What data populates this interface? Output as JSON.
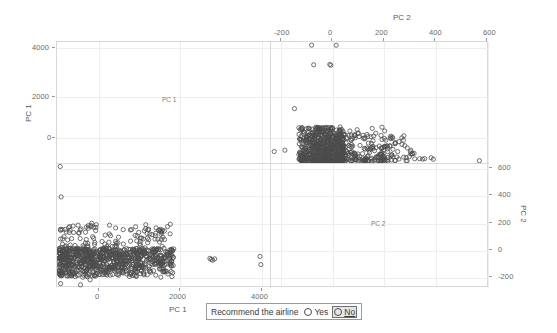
{
  "chart_data": {
    "type": "scatter",
    "title": "",
    "layout": "scatterplot-matrix",
    "variables": [
      "PC 1",
      "PC 2"
    ],
    "grid": true,
    "legend": {
      "position": "bottom",
      "title": "Recommend the airline",
      "entries": [
        {
          "label": "Yes",
          "marker": "open-circle",
          "color": "#4c4c4c",
          "selected": false
        },
        {
          "label": "No",
          "marker": "open-circle",
          "color": "#4c4c4c",
          "selected": true
        }
      ]
    },
    "panels": [
      {
        "id": "top-left",
        "row": 0,
        "col": 0,
        "diagonal": true,
        "cell_label": "PC 1",
        "x_variable": "PC 1",
        "y_variable": "PC 1",
        "n_points": 0
      },
      {
        "id": "top-right",
        "row": 0,
        "col": 1,
        "diagonal": false,
        "x_variable": "PC 2",
        "y_variable": "PC 1",
        "xlim": [
          -320,
          700
        ],
        "ylim": [
          -900,
          4400
        ],
        "n_points": 980
      },
      {
        "id": "bottom-left",
        "row": 1,
        "col": 0,
        "diagonal": false,
        "x_variable": "PC 1",
        "y_variable": "PC 2",
        "xlim": [
          -850,
          4500
        ],
        "ylim": [
          -280,
          700
        ],
        "n_points": 980
      },
      {
        "id": "bottom-right",
        "row": 1,
        "col": 1,
        "diagonal": true,
        "cell_label": "PC 2",
        "x_variable": "PC 2",
        "y_variable": "PC 2",
        "n_points": 0
      }
    ],
    "axes": {
      "left": {
        "title": "PC 1",
        "variable": "PC 1",
        "ticks": [
          4000,
          2000,
          0
        ],
        "tick_labels": [
          "4000",
          "2000",
          "0"
        ],
        "range": [
          -900,
          4400
        ]
      },
      "top": {
        "title": "PC 2",
        "variable": "PC 2",
        "ticks": [
          -200,
          0,
          200,
          400,
          600
        ],
        "tick_labels": [
          "-200",
          "0",
          "200",
          "400",
          "600"
        ],
        "range": [
          -320,
          700
        ]
      },
      "right": {
        "title": "PC 2",
        "variable": "PC 2",
        "ticks": [
          600,
          400,
          200,
          0,
          -200
        ],
        "tick_labels": [
          "600",
          "400",
          "200",
          "0",
          "-200"
        ],
        "range": [
          -280,
          700
        ]
      },
      "bottom": {
        "title": "PC 1",
        "variable": "PC 1",
        "ticks": [
          0,
          2000,
          4000
        ],
        "tick_labels": [
          "0",
          "2000",
          "4000"
        ],
        "range": [
          -850,
          4500
        ]
      }
    },
    "marker_style": {
      "shape": "open-circle",
      "stroke": "#4c4c4c",
      "radius_px": 2.1
    }
  },
  "axis_left": {
    "title": "PC 1",
    "t0": "4000",
    "t1": "2000",
    "t2": "0"
  },
  "axis_top": {
    "title": "PC 2",
    "t0": "-200",
    "t1": "0",
    "t2": "200",
    "t3": "400",
    "t4": "600"
  },
  "axis_right": {
    "title": "PC 2",
    "t0": "600",
    "t1": "400",
    "t2": "200",
    "t3": "0",
    "t4": "-200"
  },
  "axis_bottom": {
    "title": "PC 1",
    "t0": "0",
    "t1": "2000",
    "t2": "4000"
  },
  "cells": {
    "diag_tl_label": "PC 1",
    "diag_br_label": "PC 2"
  },
  "legend": {
    "title": "Recommend the airline",
    "yes": "Yes",
    "no": "No"
  }
}
